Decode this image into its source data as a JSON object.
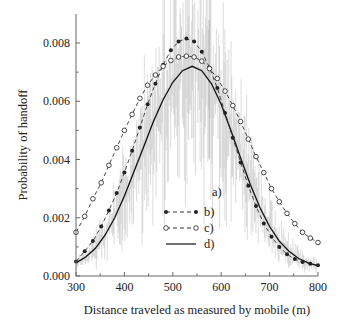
{
  "chart_data": {
    "type": "line",
    "title": "",
    "xlabel": "Distance traveled as measured by mobile (m)",
    "ylabel": "Probability of handoff",
    "xlim": [
      300,
      800
    ],
    "ylim": [
      0.0,
      0.009
    ],
    "xticks": [
      300,
      400,
      500,
      600,
      700,
      800
    ],
    "xtick_labels": [
      "300",
      "400",
      "500",
      "600",
      "700",
      "800"
    ],
    "yticks": [
      0.0,
      0.002,
      0.004,
      0.006,
      0.008
    ],
    "ytick_labels": [
      "0.000",
      "0.002",
      "0.004",
      "0.006",
      "0.008"
    ],
    "grid": false,
    "legend_position": "center-right",
    "legend": [
      {
        "key": "a",
        "label": "a)",
        "style": "noisy-gray"
      },
      {
        "key": "b",
        "label": "b)",
        "style": "dashed-filled-marker"
      },
      {
        "key": "c",
        "label": "c)",
        "style": "dashed-open-circle"
      },
      {
        "key": "d",
        "label": "d)",
        "style": "solid"
      }
    ],
    "series": [
      {
        "name": "b)",
        "x": [
          300,
          318,
          335,
          352,
          368,
          384,
          400,
          416,
          432,
          448,
          464,
          480,
          496,
          512,
          528,
          544,
          560,
          576,
          592,
          608,
          624,
          640,
          656,
          672,
          688,
          704,
          720,
          736,
          752,
          768,
          784,
          800
        ],
        "y": [
          0.0005,
          0.00085,
          0.0012,
          0.0017,
          0.00225,
          0.00285,
          0.00355,
          0.0043,
          0.0051,
          0.0059,
          0.0066,
          0.00725,
          0.00775,
          0.00805,
          0.00815,
          0.00805,
          0.0077,
          0.00715,
          0.00645,
          0.0056,
          0.00475,
          0.0039,
          0.0031,
          0.0024,
          0.0018,
          0.00135,
          0.001,
          0.00075,
          0.00058,
          0.00048,
          0.00042,
          0.00037
        ]
      },
      {
        "name": "c)",
        "x": [
          300,
          318,
          335,
          352,
          368,
          384,
          400,
          416,
          432,
          448,
          464,
          480,
          496,
          512,
          528,
          544,
          560,
          576,
          592,
          608,
          624,
          640,
          656,
          672,
          688,
          704,
          720,
          736,
          752,
          768,
          784,
          800
        ],
        "y": [
          0.0015,
          0.00205,
          0.00265,
          0.0032,
          0.0038,
          0.0044,
          0.005,
          0.00555,
          0.0061,
          0.00655,
          0.0069,
          0.0072,
          0.0074,
          0.00752,
          0.00755,
          0.00752,
          0.00738,
          0.00712,
          0.00678,
          0.00635,
          0.00585,
          0.0053,
          0.0047,
          0.0041,
          0.00355,
          0.003,
          0.00255,
          0.00215,
          0.0018,
          0.0015,
          0.0013,
          0.00115
        ]
      },
      {
        "name": "d)",
        "x": [
          300,
          320,
          340,
          360,
          380,
          400,
          420,
          440,
          460,
          480,
          500,
          520,
          540,
          560,
          580,
          600,
          620,
          640,
          660,
          680,
          700,
          720,
          740,
          760,
          780,
          800
        ],
        "y": [
          0.00045,
          0.00065,
          0.00095,
          0.0014,
          0.002,
          0.00275,
          0.0036,
          0.00445,
          0.0053,
          0.00605,
          0.00665,
          0.00705,
          0.0072,
          0.00705,
          0.0066,
          0.0059,
          0.005,
          0.00405,
          0.00315,
          0.00235,
          0.0017,
          0.0012,
          0.00085,
          0.0006,
          0.00045,
          0.00035
        ]
      },
      {
        "name": "a)",
        "description": "noisy measured histogram centered around d) curve, spikes up to ~0.0088 near 575 m",
        "x_range": [
          300,
          800
        ],
        "peak_spike_x": 575,
        "peak_spike_y": 0.0088
      }
    ]
  }
}
